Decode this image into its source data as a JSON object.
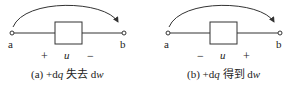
{
  "diagrams": [
    {
      "id": "a",
      "node_left": "a",
      "node_right": "b",
      "variable": "u",
      "sign_left": "+",
      "sign_right": "−",
      "caption_prefix": "(a) +d",
      "caption_q": "q",
      "caption_text": " 失去 d",
      "caption_w": "w"
    },
    {
      "id": "b",
      "node_left": "a",
      "node_right": "b",
      "variable": "u",
      "sign_left": "−",
      "sign_right": "+",
      "caption_prefix": "(b) +d",
      "caption_q": "q",
      "caption_text": " 得到 d",
      "caption_w": "w"
    }
  ],
  "colors": {
    "stroke": "#333333",
    "text": "#222222"
  }
}
